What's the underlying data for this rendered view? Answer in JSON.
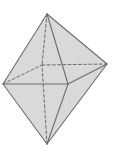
{
  "diagram": {
    "type": "octahedron",
    "vertices": [
      "top",
      "bottom",
      "left",
      "right",
      "front",
      "back"
    ],
    "visible_edges": [
      [
        "top",
        "left"
      ],
      [
        "top",
        "front"
      ],
      [
        "top",
        "right"
      ],
      [
        "bottom",
        "left"
      ],
      [
        "bottom",
        "front"
      ],
      [
        "bottom",
        "right"
      ],
      [
        "left",
        "front"
      ],
      [
        "front",
        "right"
      ]
    ],
    "hidden_edges": [
      [
        "top",
        "back"
      ],
      [
        "bottom",
        "back"
      ],
      [
        "left",
        "back"
      ],
      [
        "back",
        "right"
      ]
    ],
    "colors": {
      "face": "#d9d9d9",
      "edge": "#6e6e6e",
      "background": "#ffffff"
    }
  }
}
